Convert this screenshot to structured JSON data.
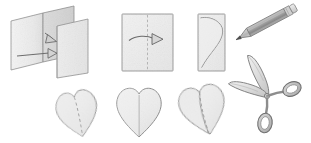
{
  "illustration": {
    "title": "Paper heart cutting instructions",
    "description": "Six-step pencil-shaded craft diagram: fold paper, fold again, draw half heart, cut out heart",
    "background_color": "#ffffff",
    "paper_fill": "#f2f2f2",
    "paper_fill_shaded": "#d9d9d9",
    "outline_color": "#8a8a8a",
    "pencil_color": "#9a9a9a",
    "graphite_color": "#4a4a4a",
    "scissor_metal": "#d2d2d2",
    "scissor_outline": "#7d7d7d"
  },
  "steps": [
    {
      "index": 1,
      "name": "fold-paper-in-half",
      "label": "Step 1: Fold sheet in half",
      "shape": "open-folded-card",
      "arrows": [
        "straight-right-arrow",
        "angled-fold-arrow"
      ]
    },
    {
      "index": 2,
      "name": "fold-again",
      "label": "Step 2: Fold again along center",
      "shape": "square-panel",
      "arrows": [
        "curved-right-arrow"
      ],
      "fold_line": "dashed-vertical"
    },
    {
      "index": 3,
      "name": "draw-half-heart",
      "label": "Step 3: Draw half heart on folded edge",
      "shape": "rectangle-panel",
      "drawing": "half-heart-curve"
    },
    {
      "index": 4,
      "name": "heart-dashed-fold",
      "label": "Step 4: Cut out heart",
      "shape": "heart",
      "fold_line": "dashed-center"
    },
    {
      "index": 5,
      "name": "heart-flat",
      "label": "Step 5: Unfold heart",
      "shape": "heart",
      "fold_line": "solid-center"
    },
    {
      "index": 6,
      "name": "heart-opening",
      "label": "Step 6: Finished folded heart",
      "shape": "heart-with-flap",
      "fold_line": "dashed-diagonal"
    }
  ],
  "tools": [
    {
      "name": "pencil",
      "label": "Pencil",
      "position": "top-right",
      "orientation": "diagonal-tip-lower-left"
    },
    {
      "name": "scissors",
      "label": "Scissors",
      "position": "right",
      "orientation": "blades-upper-left"
    }
  ]
}
